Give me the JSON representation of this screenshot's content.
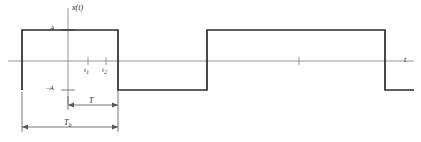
{
  "figure": {
    "name": "bipolar-rectangular-pulse-train-waveform",
    "background_color": "#ffffff",
    "line_color": "#2b2b2b",
    "axis_color": "#8a8a8a",
    "width": 421,
    "height": 142
  },
  "labels": {
    "signal_axis": "x(t)",
    "time_axis": "t",
    "amplitude_positive": "A",
    "amplitude_negative": "–A",
    "tick_t1_base": "t",
    "tick_t1_sub": "1",
    "tick_t2_base": "t",
    "tick_t2_sub": "2",
    "period_T": "T",
    "period_Tb_base": "T",
    "period_Tb_sub": "b"
  },
  "chart_data": {
    "type": "line",
    "title": "",
    "xlabel": "t",
    "ylabel": "x(t)",
    "amplitude": "A",
    "levels": [
      -1,
      1
    ],
    "ylim": [
      -1.45,
      1.45
    ],
    "xlim": [
      0,
      421
    ],
    "grid": false,
    "legend": false,
    "y_axis_x_px": 68,
    "zero_line_y_px": 61,
    "high_level_y_px": 30,
    "low_level_y_px": 90,
    "axis_left_px": 8,
    "axis_right_px": 414,
    "waveform_points_px": [
      {
        "x": 22,
        "y": 90
      },
      {
        "x": 22,
        "y": 30
      },
      {
        "x": 118,
        "y": 30
      },
      {
        "x": 118,
        "y": 90
      },
      {
        "x": 207,
        "y": 90
      },
      {
        "x": 207,
        "y": 30
      },
      {
        "x": 385,
        "y": 30
      },
      {
        "x": 385,
        "y": 90
      },
      {
        "x": 414,
        "y": 90
      }
    ],
    "waveform_start_stub_x_px": 8,
    "ticks": [
      {
        "label": "t1",
        "x_px": 88
      },
      {
        "label": "t2",
        "x_px": 106
      },
      {
        "label": "",
        "x_px": 299
      }
    ],
    "annotations": [
      {
        "name": "T",
        "from_x_px": 68,
        "to_x_px": 118,
        "y_px": 105,
        "label": "T"
      },
      {
        "name": "Tb",
        "from_x_px": 22,
        "to_x_px": 118,
        "y_px": 127,
        "label": "Tb"
      }
    ]
  }
}
